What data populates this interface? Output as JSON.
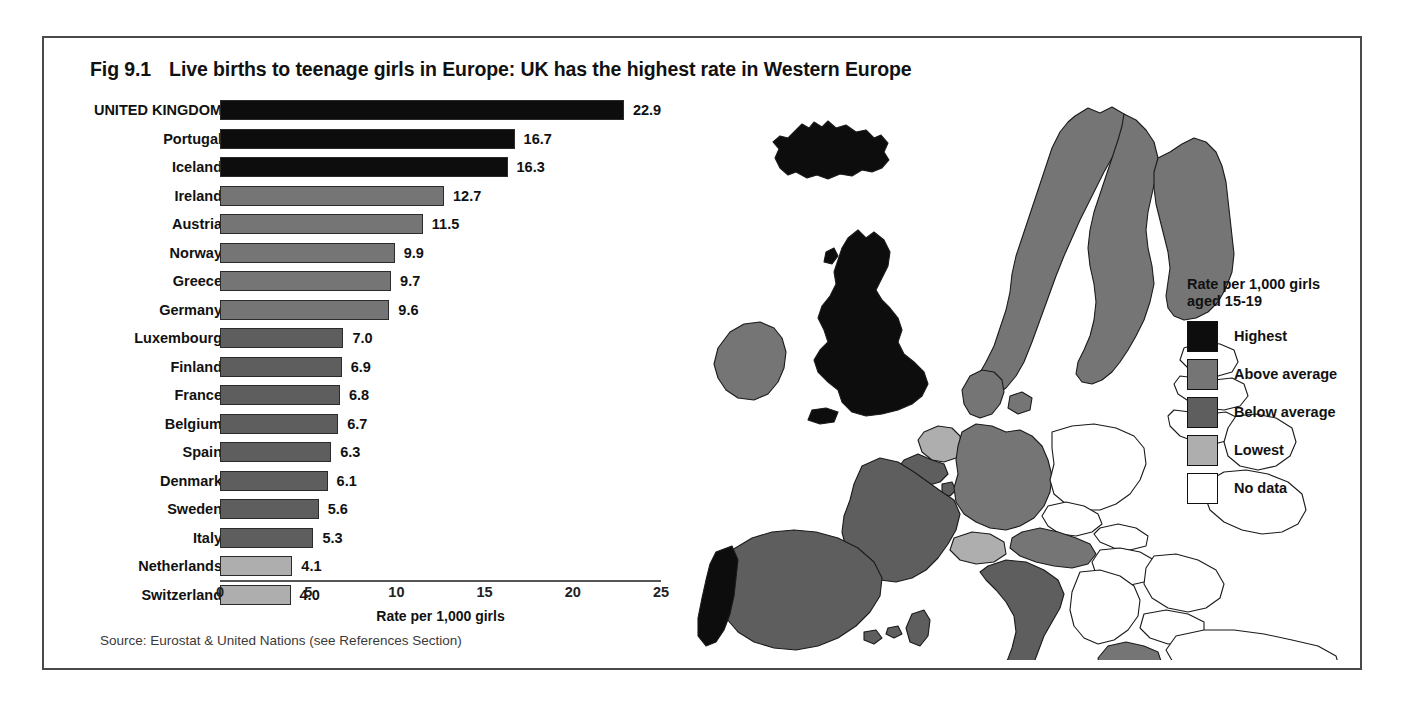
{
  "figure": {
    "number": "Fig 9.1",
    "title": "Live births to teenage girls in Europe:  UK has the highest rate in Western Europe",
    "source": "Source: Eurostat & United Nations (see References Section)"
  },
  "legend": {
    "title_line1": "Rate per 1,000 girls",
    "title_line2": "aged 15-19",
    "items": [
      {
        "label": "Highest",
        "color": "#0d0d0d"
      },
      {
        "label": "Above average",
        "color": "#757575"
      },
      {
        "label": "Below average",
        "color": "#5e5e5e"
      },
      {
        "label": "Lowest",
        "color": "#aeaeae"
      },
      {
        "label": "No data",
        "color": "#ffffff"
      }
    ]
  },
  "chart_data": {
    "type": "bar",
    "orientation": "horizontal",
    "title": "Live births to teenage girls in Europe:  UK has the highest rate in Western Europe",
    "xlabel": "Rate per 1,000 girls",
    "ylabel": "",
    "xlim": [
      0,
      25
    ],
    "xticks": [
      0,
      5,
      10,
      15,
      20,
      25
    ],
    "xtick_labels": [
      "0",
      "5",
      "10",
      "15",
      "20",
      "25"
    ],
    "grid": false,
    "legend_position": "right",
    "categories": [
      "UNITED KINGDOM",
      "Portugal",
      "Iceland",
      "Ireland",
      "Austria",
      "Norway",
      "Greece",
      "Germany",
      "Luxembourg",
      "Finland",
      "France",
      "Belgium",
      "Spain",
      "Denmark",
      "Sweden",
      "Italy",
      "Netherlands",
      "Switzerland"
    ],
    "values": [
      22.9,
      16.7,
      16.3,
      12.7,
      11.5,
      9.9,
      9.7,
      9.6,
      7.0,
      6.9,
      6.8,
      6.7,
      6.3,
      6.1,
      5.6,
      5.3,
      4.1,
      4.0
    ],
    "value_labels": [
      "22.9",
      "16.7",
      "16.3",
      "12.7",
      "11.5",
      "9.9",
      "9.7",
      "9.6",
      "7.0",
      "6.9",
      "6.8",
      "6.7",
      "6.3",
      "6.1",
      "5.6",
      "5.3",
      "4.1",
      "4.0"
    ],
    "bar_classes": [
      "Highest",
      "Highest",
      "Highest",
      "Above average",
      "Above average",
      "Above average",
      "Above average",
      "Above average",
      "Below average",
      "Below average",
      "Below average",
      "Below average",
      "Below average",
      "Below average",
      "Below average",
      "Below average",
      "Lowest",
      "Lowest"
    ],
    "bar_colors": [
      "#0d0d0d",
      "#0d0d0d",
      "#0d0d0d",
      "#757575",
      "#757575",
      "#757575",
      "#757575",
      "#757575",
      "#5e5e5e",
      "#5e5e5e",
      "#5e5e5e",
      "#5e5e5e",
      "#5e5e5e",
      "#5e5e5e",
      "#5e5e5e",
      "#5e5e5e",
      "#aeaeae",
      "#aeaeae"
    ]
  },
  "map": {
    "name": "europe-choropleth",
    "country_shading": [
      {
        "country": "Iceland",
        "class": "Highest"
      },
      {
        "country": "United Kingdom",
        "class": "Highest"
      },
      {
        "country": "Portugal",
        "class": "Highest"
      },
      {
        "country": "Ireland",
        "class": "Above average"
      },
      {
        "country": "Norway",
        "class": "Above average"
      },
      {
        "country": "Sweden",
        "class": "Above average"
      },
      {
        "country": "Finland",
        "class": "Above average"
      },
      {
        "country": "Denmark",
        "class": "Above average"
      },
      {
        "country": "Austria",
        "class": "Above average"
      },
      {
        "country": "Germany",
        "class": "Above average"
      },
      {
        "country": "Greece",
        "class": "Above average"
      },
      {
        "country": "France",
        "class": "Below average"
      },
      {
        "country": "Spain",
        "class": "Below average"
      },
      {
        "country": "Italy",
        "class": "Below average"
      },
      {
        "country": "Belgium",
        "class": "Below average"
      },
      {
        "country": "Luxembourg",
        "class": "Below average"
      },
      {
        "country": "Netherlands",
        "class": "Lowest"
      },
      {
        "country": "Switzerland",
        "class": "Lowest"
      },
      {
        "country": "Poland",
        "class": "No data"
      },
      {
        "country": "Czechia",
        "class": "No data"
      },
      {
        "country": "Slovakia",
        "class": "No data"
      },
      {
        "country": "Hungary",
        "class": "No data"
      },
      {
        "country": "Romania",
        "class": "No data"
      },
      {
        "country": "Bulgaria",
        "class": "No data"
      },
      {
        "country": "Turkey",
        "class": "No data"
      },
      {
        "country": "Estonia",
        "class": "No data"
      },
      {
        "country": "Latvia",
        "class": "No data"
      },
      {
        "country": "Lithuania",
        "class": "No data"
      },
      {
        "country": "Belarus",
        "class": "No data"
      },
      {
        "country": "Ukraine",
        "class": "No data"
      },
      {
        "country": "Balkans",
        "class": "No data"
      }
    ]
  }
}
